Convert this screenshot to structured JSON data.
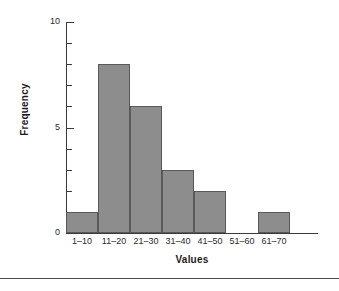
{
  "chart_data": {
    "type": "bar",
    "title": "",
    "subtitle": "",
    "xlabel": "Values",
    "ylabel": "Frequency",
    "categories": [
      "1–10",
      "11–20",
      "21–30",
      "31–40",
      "41–50",
      "51–60",
      "61–70"
    ],
    "values": [
      1,
      8,
      6,
      3,
      2,
      0,
      1
    ],
    "ylim": [
      0,
      10
    ],
    "y_major_ticks": [
      0,
      5,
      10
    ],
    "y_major_tick_labels": [
      "0",
      "5",
      "10"
    ],
    "y_minor_ticks": [
      1,
      2,
      3,
      4,
      6,
      7,
      8,
      9
    ],
    "grid": false,
    "legend": false,
    "legend_position": "none",
    "annotations": [],
    "bar_fill_color": "#8d8d8d",
    "bar_edge_color": "#595959",
    "axis_color": "#3a3a3a",
    "background_color": "#ffffff"
  },
  "figure": {
    "divider_color": "#4a4a4a"
  }
}
